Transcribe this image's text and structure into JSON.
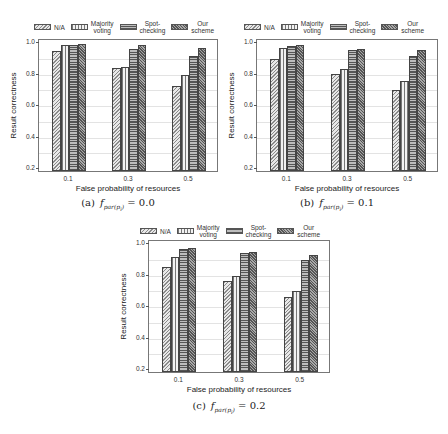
{
  "legend": {
    "items": [
      {
        "label": "N/A",
        "pattern": "na"
      },
      {
        "label": "Majority\nvoting",
        "pattern": "mv"
      },
      {
        "label": "Spot-\nchecking",
        "pattern": "sc"
      },
      {
        "label": "Our\nscheme",
        "pattern": "os"
      }
    ]
  },
  "chart_data": [
    {
      "type": "bar",
      "title": "(a) f_par(p_i) = 0.0",
      "caption_prefix": "(a)",
      "caption_value": "0.0",
      "xlabel": "False probability of resources",
      "ylabel": "Result correctness",
      "categories": [
        "0.1",
        "0.3",
        "0.5"
      ],
      "yticks": [
        "0.2",
        "0.4",
        "0.6",
        "0.8",
        "1.0"
      ],
      "ylim": [
        0.2,
        1.0
      ],
      "grid": true,
      "legend_position": "top",
      "series": [
        {
          "name": "N/A",
          "values": [
            0.95,
            0.84,
            0.73
          ]
        },
        {
          "name": "Majority voting",
          "values": [
            0.985,
            0.85,
            0.8
          ]
        },
        {
          "name": "Spot-checking",
          "values": [
            0.99,
            0.965,
            0.92
          ]
        },
        {
          "name": "Our scheme",
          "values": [
            0.995,
            0.985,
            0.97
          ]
        }
      ]
    },
    {
      "type": "bar",
      "title": "(b) f_par(p_i) = 0.1",
      "caption_prefix": "(b)",
      "caption_value": "0.1",
      "xlabel": "False probability of resources",
      "ylabel": "Result correctness",
      "categories": [
        "0.1",
        "0.3",
        "0.5"
      ],
      "yticks": [
        "0.2",
        "0.4",
        "0.6",
        "0.8",
        "1.0"
      ],
      "ylim": [
        0.2,
        1.0
      ],
      "grid": true,
      "legend_position": "top",
      "series": [
        {
          "name": "N/A",
          "values": [
            0.9,
            0.805,
            0.7
          ]
        },
        {
          "name": "Majority voting",
          "values": [
            0.97,
            0.835,
            0.76
          ]
        },
        {
          "name": "Spot-checking",
          "values": [
            0.98,
            0.955,
            0.915
          ]
        },
        {
          "name": "Our scheme",
          "values": [
            0.985,
            0.96,
            0.955
          ]
        }
      ]
    },
    {
      "type": "bar",
      "title": "(c) f_par(p_i) = 0.2",
      "caption_prefix": "(c)",
      "caption_value": "0.2",
      "xlabel": "False probability of resources",
      "ylabel": "Result correctness",
      "categories": [
        "0.1",
        "0.3",
        "0.5"
      ],
      "yticks": [
        "0.2",
        "0.4",
        "0.6",
        "0.8",
        "1.0"
      ],
      "ylim": [
        0.2,
        1.0
      ],
      "grid": true,
      "legend_position": "top",
      "series": [
        {
          "name": "N/A",
          "values": [
            0.855,
            0.765,
            0.665
          ]
        },
        {
          "name": "Majority voting",
          "values": [
            0.92,
            0.795,
            0.7
          ]
        },
        {
          "name": "Spot-checking",
          "values": [
            0.97,
            0.945,
            0.9
          ]
        },
        {
          "name": "Our scheme",
          "values": [
            0.975,
            0.95,
            0.93
          ]
        }
      ]
    }
  ]
}
